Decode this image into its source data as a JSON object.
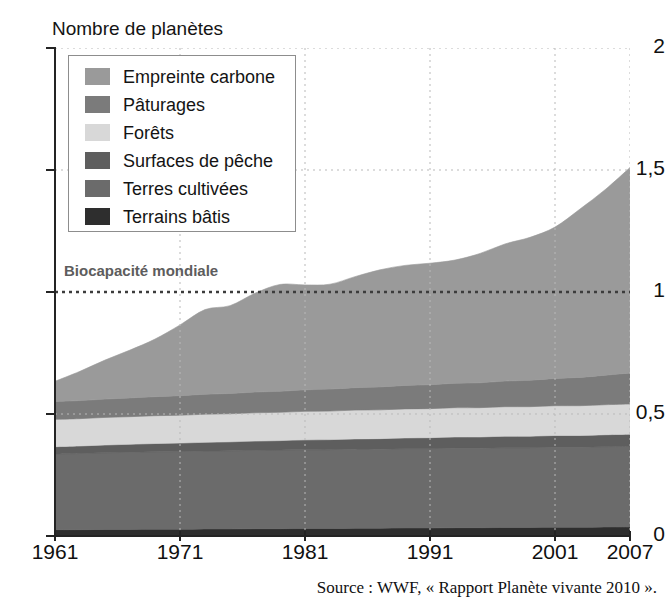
{
  "axis_title": "Nombre de planètes",
  "source_note": "Source : WWF, « Rapport Planète vivante 2010 ».",
  "biocapacity_label": "Biocapacité mondiale",
  "legend": {
    "items": [
      {
        "label": "Empreinte carbone",
        "color": "#9a9a9a"
      },
      {
        "label": "Pâturages",
        "color": "#7b7b7b"
      },
      {
        "label": "Forêts",
        "color": "#d8d8d8"
      },
      {
        "label": "Surfaces de pêche",
        "color": "#5e5e5e"
      },
      {
        "label": "Terres cultivées",
        "color": "#6b6b6b"
      },
      {
        "label": "Terrains bâtis",
        "color": "#2e2e2e"
      }
    ]
  },
  "chart_data": {
    "type": "area",
    "stacked": true,
    "title": "Nombre de planètes",
    "xlabel": "",
    "ylabel": "Nombre de planètes",
    "xlim": [
      1961,
      2007
    ],
    "ylim": [
      0,
      2
    ],
    "yticks": [
      0,
      0.5,
      1,
      1.5,
      2
    ],
    "ytick_labels": [
      "0",
      "0,5",
      "1",
      "1,5",
      "2"
    ],
    "xticks": [
      1961,
      1971,
      1981,
      1991,
      2001,
      2007
    ],
    "xtick_labels": [
      "1961",
      "1971",
      "1981",
      "1991",
      "2001",
      "2007"
    ],
    "grid": true,
    "grid_style": "dotted",
    "legend_position": "top-left",
    "annotations": [
      {
        "text": "Biocapacité mondiale",
        "type": "hline",
        "y": 1.0,
        "line_style": "dotted",
        "color": "#3c3c3c"
      }
    ],
    "x": [
      1961,
      1963,
      1965,
      1967,
      1969,
      1971,
      1973,
      1975,
      1977,
      1979,
      1981,
      1983,
      1985,
      1987,
      1989,
      1991,
      1993,
      1995,
      1997,
      1999,
      2001,
      2003,
      2005,
      2007
    ],
    "series": [
      {
        "name": "Terrains bâtis",
        "color": "#2e2e2e",
        "values": [
          0.026,
          0.026,
          0.027,
          0.027,
          0.028,
          0.028,
          0.029,
          0.029,
          0.03,
          0.03,
          0.031,
          0.031,
          0.032,
          0.032,
          0.033,
          0.033,
          0.034,
          0.034,
          0.035,
          0.035,
          0.036,
          0.036,
          0.037,
          0.037
        ]
      },
      {
        "name": "Terres cultivées",
        "color": "#6b6b6b",
        "values": [
          0.31,
          0.312,
          0.314,
          0.316,
          0.317,
          0.318,
          0.319,
          0.32,
          0.321,
          0.322,
          0.323,
          0.323,
          0.324,
          0.324,
          0.325,
          0.325,
          0.326,
          0.326,
          0.327,
          0.327,
          0.328,
          0.328,
          0.329,
          0.33
        ]
      },
      {
        "name": "Surfaces de pêche",
        "color": "#5e5e5e",
        "values": [
          0.03,
          0.031,
          0.032,
          0.033,
          0.034,
          0.035,
          0.036,
          0.037,
          0.038,
          0.039,
          0.04,
          0.041,
          0.042,
          0.043,
          0.044,
          0.045,
          0.046,
          0.046,
          0.047,
          0.047,
          0.048,
          0.048,
          0.049,
          0.05
        ]
      },
      {
        "name": "Forêts",
        "color": "#d8d8d8",
        "values": [
          0.112,
          0.112,
          0.113,
          0.113,
          0.114,
          0.114,
          0.115,
          0.115,
          0.116,
          0.116,
          0.117,
          0.117,
          0.118,
          0.118,
          0.119,
          0.119,
          0.12,
          0.12,
          0.121,
          0.121,
          0.122,
          0.122,
          0.123,
          0.124
        ]
      },
      {
        "name": "Pâturages",
        "color": "#7b7b7b",
        "values": [
          0.073,
          0.074,
          0.075,
          0.077,
          0.078,
          0.08,
          0.082,
          0.083,
          0.085,
          0.086,
          0.088,
          0.09,
          0.092,
          0.094,
          0.096,
          0.098,
          0.1,
          0.102,
          0.105,
          0.108,
          0.112,
          0.116,
          0.121,
          0.127
        ]
      },
      {
        "name": "Empreinte carbone",
        "color": "#9a9a9a",
        "values": [
          0.083,
          0.12,
          0.16,
          0.196,
          0.236,
          0.29,
          0.347,
          0.36,
          0.405,
          0.438,
          0.43,
          0.43,
          0.455,
          0.48,
          0.492,
          0.498,
          0.505,
          0.53,
          0.562,
          0.586,
          0.62,
          0.69,
          0.76,
          0.842
        ]
      }
    ],
    "totals": [
      0.634,
      0.675,
      0.721,
      0.762,
      0.807,
      0.865,
      0.928,
      0.944,
      0.995,
      1.031,
      1.029,
      1.032,
      1.063,
      1.091,
      1.109,
      1.118,
      1.131,
      1.158,
      1.197,
      1.224,
      1.266,
      1.34,
      1.419,
      1.51
    ]
  }
}
